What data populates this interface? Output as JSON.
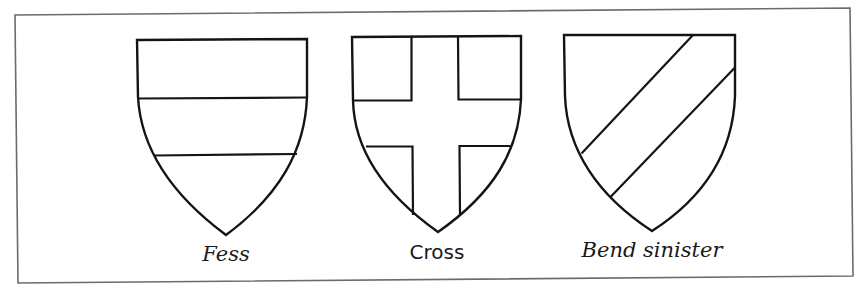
{
  "figure": {
    "background": "#ffffff",
    "frame_color": "#6b6b6b",
    "line_color": "#141414",
    "shields": [
      {
        "id": "fess",
        "label": "Fess"
      },
      {
        "id": "cross",
        "label": "Cross"
      },
      {
        "id": "bend-sinister",
        "label": "Bend sinister"
      }
    ]
  }
}
